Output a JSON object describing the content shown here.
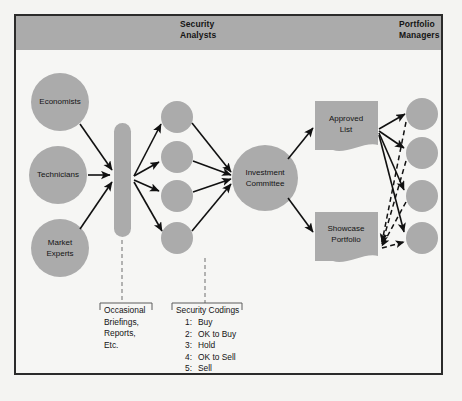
{
  "diagram": {
    "bands": {
      "security_analysts": "Security\nAnalysts",
      "portfolio_managers": "Portfolio\nManagers"
    },
    "inputs": [
      {
        "id": "economists",
        "label": "Economists"
      },
      {
        "id": "technicians",
        "label": "Technicians"
      },
      {
        "id": "market-experts",
        "label": "Market\nExperts"
      }
    ],
    "aggregator": {
      "id": "research-bar",
      "label": ""
    },
    "analysts": [
      {
        "id": "analyst-1",
        "label": ""
      },
      {
        "id": "analyst-2",
        "label": ""
      },
      {
        "id": "analyst-3",
        "label": ""
      },
      {
        "id": "analyst-4",
        "label": ""
      }
    ],
    "committee": {
      "id": "investment-committee",
      "label": "Investment\nCommittee"
    },
    "outputs": [
      {
        "id": "approved-list",
        "label": "Approved\nList"
      },
      {
        "id": "showcase-portfolio",
        "label": "Showcase\nPortfolio"
      }
    ],
    "portfolios": [
      {
        "id": "portfolio-1",
        "label": ""
      },
      {
        "id": "portfolio-2",
        "label": ""
      },
      {
        "id": "portfolio-3",
        "label": ""
      },
      {
        "id": "portfolio-4",
        "label": ""
      }
    ],
    "legend": {
      "occasional": "Occasional\nBriefings,\nReports,\nEtc.",
      "codings_title": "Security Codings",
      "codings": [
        {
          "num": "1:",
          "label": "Buy"
        },
        {
          "num": "2:",
          "label": "OK to Buy"
        },
        {
          "num": "3:",
          "label": "Hold"
        },
        {
          "num": "4:",
          "label": "OK to Sell"
        },
        {
          "num": "5:",
          "label": "Sell"
        }
      ]
    },
    "colors": {
      "shape_gray": "#ababab",
      "band_gray": "#ababab",
      "line_black": "#111111",
      "frame_border": "#2b2b2b",
      "page_background": "#f4f4f2"
    }
  }
}
